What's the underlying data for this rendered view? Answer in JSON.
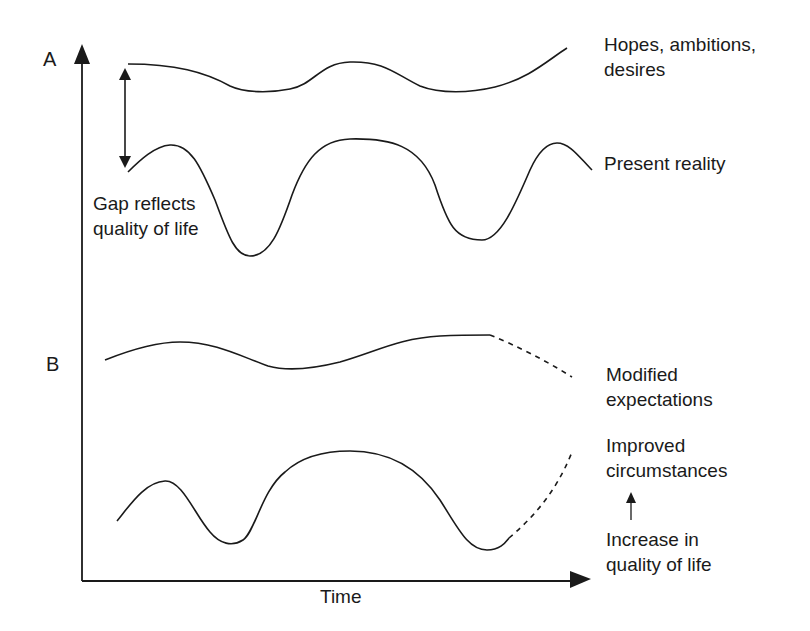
{
  "panels": {
    "a": {
      "label": "A"
    },
    "b": {
      "label": "B"
    }
  },
  "axes": {
    "x_label": "Time"
  },
  "annotations": {
    "gap_line1": "Gap reflects",
    "gap_line2": "quality of life",
    "hopes_line1": "Hopes, ambitions,",
    "hopes_line2": "desires",
    "present": "Present reality",
    "modified_line1": "Modified",
    "modified_line2": "expectations",
    "improved_line1": "Improved",
    "improved_line2": "circumstances",
    "increase_line1": "Increase in",
    "increase_line2": "quality of life"
  },
  "colors": {
    "stroke": "#1a1a1a",
    "background": "#ffffff"
  }
}
